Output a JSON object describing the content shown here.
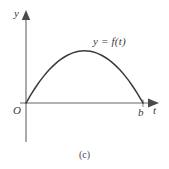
{
  "figure": {
    "caption": "(c)",
    "background_color": "#ffffff",
    "stroke_color": "#3a3a3a",
    "axis_color": "#555555",
    "width": 169,
    "height": 169
  },
  "labels": {
    "y_axis": "y",
    "t_axis": "t",
    "origin": "O",
    "upper_limit": "b",
    "function": "y = f(t)"
  },
  "chart_data": {
    "type": "line",
    "title": "",
    "subtitle": "",
    "xlabel": "t",
    "ylabel": "y",
    "grid": false,
    "legend_position": "none",
    "annotations": [
      {
        "text": "y = f(t)",
        "x": 0.62,
        "y": 0.93,
        "role": "curve-label"
      },
      {
        "text": "O",
        "x": 0.0,
        "y": 0.0,
        "role": "origin-label"
      },
      {
        "text": "b",
        "x": 1.0,
        "y": 0.0,
        "role": "x-intercept-label"
      },
      {
        "text": "(c)",
        "role": "figure-caption"
      }
    ],
    "xlim": [
      0,
      1.13
    ],
    "ylim": [
      0,
      1.18
    ],
    "x_tick_labels": [
      "O",
      "b"
    ],
    "y_tick_labels": [],
    "series": [
      {
        "name": "y = f(t)",
        "description": "Concave-down arc from origin rising to a maximum near the middle and returning to zero at t = b",
        "x": [
          0.0,
          0.05,
          0.1,
          0.15,
          0.2,
          0.25,
          0.3,
          0.35,
          0.4,
          0.45,
          0.5,
          0.55,
          0.6,
          0.65,
          0.7,
          0.75,
          0.8,
          0.85,
          0.9,
          0.95,
          1.0
        ],
        "y": [
          0.0,
          0.19,
          0.36,
          0.51,
          0.64,
          0.75,
          0.84,
          0.91,
          0.96,
          0.99,
          1.0,
          0.99,
          0.96,
          0.91,
          0.84,
          0.75,
          0.64,
          0.51,
          0.36,
          0.19,
          0.0
        ]
      }
    ]
  }
}
